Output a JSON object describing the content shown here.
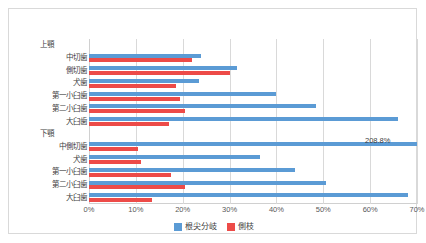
{
  "chart_data": {
    "type": "bar",
    "orientation": "horizontal",
    "title": "",
    "xlabel": "",
    "ylabel": "",
    "xlim": [
      0,
      70
    ],
    "xticks": [
      "0%",
      "10%",
      "20%",
      "30%",
      "40%",
      "50%",
      "60%",
      "70%"
    ],
    "xtick_values": [
      0,
      10,
      20,
      30,
      40,
      50,
      60,
      70
    ],
    "grid": true,
    "legend_position": "bottom",
    "groups": [
      {
        "label": "上顎",
        "categories": [
          "中切歯",
          "側切歯",
          "犬歯",
          "第一小臼歯",
          "第二小臼歯",
          "大臼歯"
        ]
      },
      {
        "label": "下顎",
        "categories": [
          "中側切歯",
          "犬歯",
          "第一小臼歯",
          "第二小臼歯",
          "大臼歯"
        ]
      }
    ],
    "categories": [
      "中切歯",
      "側切歯",
      "犬歯",
      "第一小臼歯",
      "第二小臼歯",
      "大臼歯",
      "中側切歯",
      "犬歯",
      "第一小臼歯",
      "第二小臼歯",
      "大臼歯"
    ],
    "series": [
      {
        "name": "根尖分岐",
        "color": "#5b9bd5",
        "values": [
          24.0,
          31.5,
          23.5,
          40.0,
          48.5,
          66.0,
          208.8,
          36.5,
          44.0,
          50.5,
          68.0
        ]
      },
      {
        "name": "側枝",
        "color": "#ed4b48",
        "values": [
          22.0,
          30.0,
          18.5,
          19.5,
          20.5,
          17.0,
          10.5,
          11.0,
          17.5,
          20.5,
          13.5
        ]
      }
    ],
    "annotations": [
      {
        "text": "208.8%",
        "category": "中側切歯",
        "series": "根尖分岐"
      }
    ]
  },
  "legend": {
    "items": [
      {
        "label": "根尖分岐",
        "color": "#5b9bd5"
      },
      {
        "label": "側枝",
        "color": "#ed4b48"
      }
    ]
  }
}
